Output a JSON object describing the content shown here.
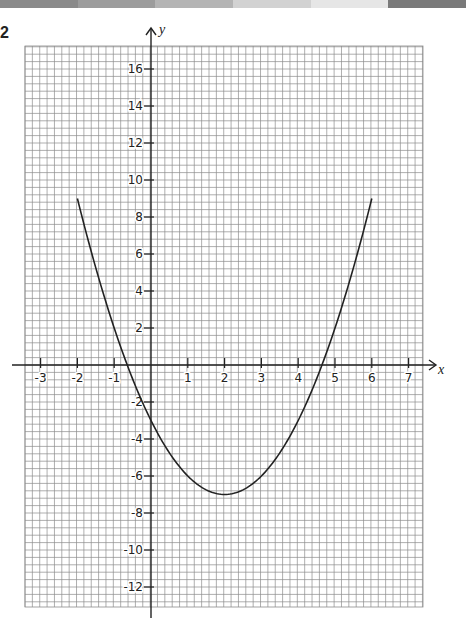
{
  "question_number": "2",
  "top_bar_colors": [
    "#8a8a8a",
    "#9c9c9c",
    "#b4b4b4",
    "#d2d2d2",
    "#e6e6e6",
    "#7a7a7a"
  ],
  "chart_data": {
    "type": "line",
    "title": "",
    "xlabel": "x",
    "ylabel": "y",
    "xlim": [
      -3.3,
      7.5
    ],
    "ylim": [
      -13,
      17
    ],
    "grid": true,
    "x_ticks": [
      -3,
      -2,
      -1,
      1,
      2,
      3,
      4,
      5,
      6,
      7
    ],
    "y_ticks": [
      16,
      14,
      12,
      10,
      8,
      6,
      4,
      2,
      -2,
      -4,
      -6,
      -8,
      -10,
      -12
    ],
    "series": [
      {
        "name": "y = x^2 - 4x - 3",
        "x": [
          -2,
          -1.5,
          -1,
          -0.5,
          0,
          0.5,
          1,
          1.5,
          2,
          2.5,
          3,
          3.5,
          4,
          4.5,
          5,
          5.5,
          6
        ],
        "y": [
          9,
          5.25,
          2,
          -0.75,
          -3,
          -4.75,
          -6,
          -6.75,
          -7,
          -6.75,
          -6,
          -4.75,
          -3,
          -0.75,
          2,
          5.25,
          9
        ]
      }
    ],
    "annotations": {
      "vertex": [
        2,
        -7
      ],
      "y_intercept": -3,
      "x_intercepts": [
        -0.65,
        4.65
      ]
    }
  }
}
